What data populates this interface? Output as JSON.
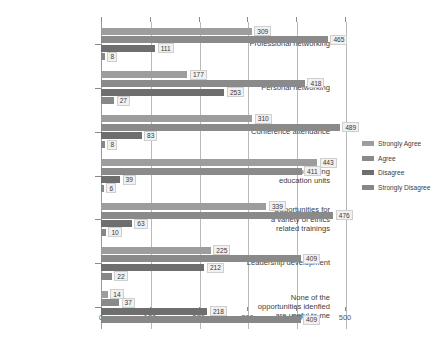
{
  "chart_data": {
    "type": "bar",
    "orientation": "horizontal",
    "title": "",
    "subtitle": "",
    "xlabel": "",
    "ylabel": "",
    "xlim": [
      0,
      500
    ],
    "xticks": [
      0,
      100,
      200,
      300,
      400,
      500
    ],
    "xtick_labels": [
      "0",
      "100",
      "200",
      "300",
      "400",
      "500"
    ],
    "grid": true,
    "grid_axis": "x",
    "legend_position": "right",
    "categories": [
      "Professional networking",
      "Personal networking",
      "Conference attendance",
      "Continuing\neducation units",
      "Opportunities for\na variety of ethics\nrelated trainings",
      "Leadership development",
      "None of the\nopportunities idenfied\nare useful to me"
    ],
    "series": [
      {
        "name": "Strongly Agree",
        "color": "#9d9d9d",
        "values": [
          309,
          177,
          310,
          443,
          339,
          225,
          14
        ]
      },
      {
        "name": "Agree",
        "color": "#8a8a8a",
        "values": [
          465,
          418,
          489,
          411,
          476,
          409,
          37
        ]
      },
      {
        "name": "Disagree",
        "color": "#6e6e6e",
        "values": [
          111,
          253,
          83,
          39,
          63,
          212,
          218
        ]
      },
      {
        "name": "Strongly Disagree",
        "color": "#878787",
        "values": [
          8,
          27,
          8,
          6,
          10,
          22,
          409
        ]
      }
    ],
    "data_labels": [
      [
        "309",
        "465",
        "111",
        "8"
      ],
      [
        "177",
        "418",
        "253",
        "27"
      ],
      [
        "310",
        "489",
        "83",
        "8"
      ],
      [
        "443",
        "411",
        "39",
        "6"
      ],
      [
        "339",
        "476",
        "63",
        "10"
      ],
      [
        "225",
        "409",
        "212",
        "22"
      ],
      [
        "14",
        "37",
        "218",
        "409"
      ]
    ]
  },
  "legend": {
    "items": [
      {
        "label": "Strongly Agree"
      },
      {
        "label": "Agree"
      },
      {
        "label": "Disagree"
      },
      {
        "label": "Strongly Disagree"
      }
    ]
  }
}
